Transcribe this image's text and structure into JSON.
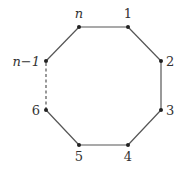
{
  "diagram": {
    "type": "polygon-cycle",
    "colors": {
      "edge": "#555555",
      "vertex": "#222222",
      "label": "#333333"
    },
    "vertices": [
      {
        "id": "n",
        "label": "n",
        "italic": true,
        "x": 79,
        "y": 27,
        "lx": 79,
        "ly": 18,
        "anchor": "middle"
      },
      {
        "id": "1",
        "label": "1",
        "italic": false,
        "x": 128,
        "y": 27,
        "lx": 128,
        "ly": 18,
        "anchor": "middle"
      },
      {
        "id": "2",
        "label": "2",
        "italic": false,
        "x": 161,
        "y": 61,
        "lx": 166,
        "ly": 66,
        "anchor": "start"
      },
      {
        "id": "3",
        "label": "3",
        "italic": false,
        "x": 161,
        "y": 110,
        "lx": 166,
        "ly": 115,
        "anchor": "start"
      },
      {
        "id": "4",
        "label": "4",
        "italic": false,
        "x": 128,
        "y": 145,
        "lx": 128,
        "ly": 161,
        "anchor": "middle"
      },
      {
        "id": "5",
        "label": "5",
        "italic": false,
        "x": 79,
        "y": 145,
        "lx": 79,
        "ly": 161,
        "anchor": "middle"
      },
      {
        "id": "6",
        "label": "6",
        "italic": false,
        "x": 46,
        "y": 110,
        "lx": 40,
        "ly": 115,
        "anchor": "end"
      },
      {
        "id": "n-1",
        "label": "n−1",
        "italic": true,
        "x": 46,
        "y": 61,
        "lx": 40,
        "ly": 66,
        "anchor": "end"
      }
    ],
    "edges": [
      {
        "from": "n",
        "to": "1",
        "style": "solid"
      },
      {
        "from": "1",
        "to": "2",
        "style": "solid"
      },
      {
        "from": "2",
        "to": "3",
        "style": "solid"
      },
      {
        "from": "3",
        "to": "4",
        "style": "solid"
      },
      {
        "from": "4",
        "to": "5",
        "style": "solid"
      },
      {
        "from": "5",
        "to": "6",
        "style": "solid"
      },
      {
        "from": "6",
        "to": "n-1",
        "style": "dashed"
      },
      {
        "from": "n-1",
        "to": "n",
        "style": "solid"
      }
    ]
  }
}
